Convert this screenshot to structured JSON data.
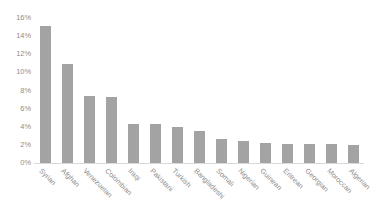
{
  "chart_data": {
    "type": "bar",
    "title": "",
    "subtitle": "",
    "xlabel": "",
    "ylabel": "",
    "ylim": [
      0,
      16
    ],
    "ytick_labels": [
      "16%",
      "14%",
      "12%",
      "10%",
      "8%",
      "6%",
      "4%",
      "2%",
      "0%"
    ],
    "ytick_values": [
      16,
      14,
      12,
      10,
      8,
      6,
      4,
      2,
      0
    ],
    "grid": false,
    "legend": false,
    "legend_position": "none",
    "value_unit": "%",
    "bar_color": "#a3a3a3",
    "axis_text_color": "#8d8d8d",
    "baseline_color": "#d9d9d9",
    "background_color": "#ffffff",
    "xtick_rotation_degrees": 45,
    "categories": [
      "Syrian",
      "Afghan",
      "Venezuelan",
      "Colombian",
      "Iraqi",
      "Pakistani",
      "Turkish",
      "Bangladeshi",
      "Somali",
      "Nigerian",
      "Guinean",
      "Eritrean",
      "Georgian",
      "Moroccan",
      "Algerian"
    ],
    "values": [
      15.1,
      10.9,
      7.4,
      7.3,
      4.3,
      4.3,
      4.0,
      3.5,
      2.7,
      2.4,
      2.2,
      2.1,
      2.1,
      2.1,
      2.0
    ]
  }
}
